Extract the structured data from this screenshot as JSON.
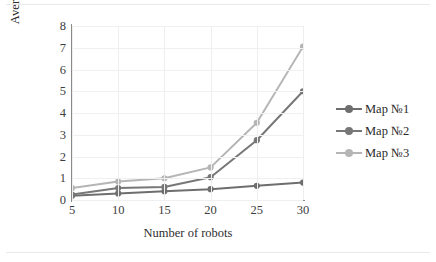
{
  "chart_data": {
    "type": "line",
    "title": "",
    "xlabel": "Number of robots",
    "ylabel": "Average time of calculation, s",
    "x": [
      5,
      10,
      15,
      20,
      25,
      30
    ],
    "xticks": [
      "5",
      "10",
      "15",
      "20",
      "25",
      "30"
    ],
    "yticks": [
      "0",
      "1",
      "2",
      "3",
      "4",
      "5",
      "6",
      "7",
      "8"
    ],
    "xlim": [
      5,
      30
    ],
    "ylim": [
      0,
      8
    ],
    "grid": true,
    "grid_axis": "both",
    "legend_position": "right",
    "series": [
      {
        "name": "Map №1",
        "color": "#6e6e6e",
        "marker": "circle",
        "values": [
          0.2,
          0.3,
          0.4,
          0.5,
          0.65,
          0.8
        ]
      },
      {
        "name": "Map №2",
        "color": "#777777",
        "marker": "circle",
        "values": [
          0.25,
          0.55,
          0.6,
          1.05,
          2.75,
          5.0
        ]
      },
      {
        "name": "Map №3",
        "color": "#b5b5b5",
        "marker": "circle",
        "values": [
          0.55,
          0.85,
          1.0,
          1.5,
          3.55,
          7.05
        ]
      }
    ]
  },
  "axes": {
    "ylabel": "Average time of calculation, s",
    "xlabel": "Number of robots",
    "yticks": [
      "8",
      "7",
      "6",
      "5",
      "4",
      "3",
      "2",
      "1",
      "0"
    ],
    "xticks": [
      "5",
      "10",
      "15",
      "20",
      "25",
      "30"
    ]
  },
  "legend": {
    "items": [
      {
        "label": "Map №1",
        "color": "#6e6e6e"
      },
      {
        "label": "Map №2",
        "color": "#777777"
      },
      {
        "label": "Map №3",
        "color": "#b5b5b5"
      }
    ]
  },
  "colors": {
    "series_1": "#6e6e6e",
    "series_2": "#777777",
    "series_3": "#b5b5b5",
    "axis": "#8a8a8a",
    "grid": "#f0f0f0",
    "text": "#2e2e2e",
    "background": "#ffffff"
  }
}
